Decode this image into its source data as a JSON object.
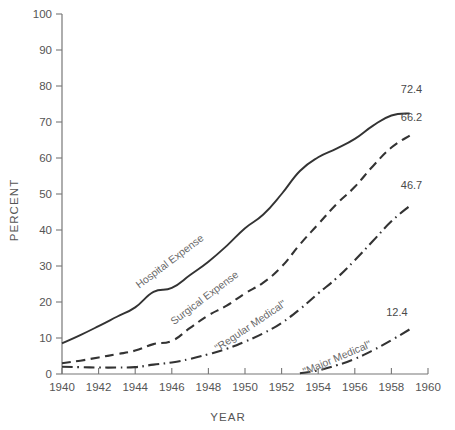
{
  "chart_data": {
    "type": "line",
    "title": "",
    "xlabel": "YEAR",
    "ylabel": "PERCENT",
    "xlim": [
      1940,
      1960
    ],
    "ylim": [
      0,
      100
    ],
    "xticks": [
      1940,
      1942,
      1944,
      1946,
      1948,
      1950,
      1952,
      1954,
      1956,
      1958,
      1960
    ],
    "xtick_labels": [
      "1940",
      "1942",
      "1944",
      "1946",
      "1948",
      "1950",
      "1952",
      "1954",
      "1956",
      "1958",
      "1960"
    ],
    "yticks": [
      0,
      10,
      20,
      30,
      40,
      50,
      60,
      70,
      80,
      90,
      100
    ],
    "ytick_labels": [
      "0",
      "10",
      "20",
      "30",
      "40",
      "50",
      "60",
      "70",
      "80",
      "90",
      "100"
    ],
    "grid": false,
    "legend_position": "inline-labels",
    "series": [
      {
        "name": "Hospital Expense",
        "label": "Hospital Expense",
        "style": "solid",
        "color": "#333333",
        "end_value_label": "72.4",
        "x": [
          1940,
          1941,
          1942,
          1943,
          1944,
          1945,
          1946,
          1947,
          1948,
          1949,
          1950,
          1951,
          1952,
          1953,
          1954,
          1955,
          1956,
          1957,
          1958,
          1959
        ],
        "values": [
          8.5,
          10.8,
          13.3,
          15.9,
          18.5,
          22.8,
          23.9,
          27.5,
          31.2,
          35.6,
          40.5,
          44.3,
          50.0,
          56.4,
          60.2,
          62.6,
          65.3,
          69.0,
          71.8,
          72.4
        ]
      },
      {
        "name": "Surgical Expense",
        "label": "Surgical Expense",
        "style": "dashed",
        "color": "#333333",
        "end_value_label": "66.2",
        "x": [
          1940,
          1941,
          1942,
          1943,
          1944,
          1945,
          1946,
          1947,
          1948,
          1949,
          1950,
          1951,
          1952,
          1953,
          1954,
          1955,
          1956,
          1957,
          1958,
          1959
        ],
        "values": [
          3.0,
          3.7,
          4.6,
          5.5,
          6.5,
          8.3,
          9.2,
          12.8,
          16.3,
          19.0,
          22.4,
          25.4,
          29.8,
          36.0,
          41.6,
          47.2,
          52.0,
          57.8,
          62.9,
          66.2
        ]
      },
      {
        "name": "Regular Medical",
        "label": "\"Regular Medical\"",
        "style": "dashdot",
        "color": "#333333",
        "end_value_label": "46.7",
        "x": [
          1940,
          1941,
          1942,
          1943,
          1944,
          1945,
          1946,
          1947,
          1948,
          1949,
          1950,
          1951,
          1952,
          1953,
          1954,
          1955,
          1956,
          1957,
          1958,
          1959
        ],
        "values": [
          2.0,
          1.9,
          1.8,
          1.8,
          1.9,
          2.6,
          3.2,
          4.2,
          5.5,
          7.0,
          9.0,
          11.3,
          14.2,
          18.0,
          22.4,
          26.6,
          31.6,
          37.0,
          42.4,
          46.7
        ]
      },
      {
        "name": "Major Medical",
        "label": "\"Major Medical\"",
        "style": "dashdot",
        "color": "#333333",
        "end_value_label": "12.4",
        "x": [
          1953,
          1954,
          1955,
          1956,
          1957,
          1958,
          1959
        ],
        "values": [
          0.2,
          1.0,
          2.4,
          4.2,
          6.6,
          9.4,
          12.4
        ]
      }
    ]
  },
  "annotations": {
    "series_labels": [
      {
        "text": "Hospital Expense",
        "x": 1946.0,
        "y": 30.5,
        "rotation": -37
      },
      {
        "text": "Surgical Expense",
        "x": 1947.9,
        "y": 20.4,
        "rotation": -37
      },
      {
        "text": "\"Regular Medical\"",
        "x": 1950.4,
        "y": 12.6,
        "rotation": -34
      },
      {
        "text": "\"Major Medical\"",
        "x": 1955.1,
        "y": 3.6,
        "rotation": -23
      }
    ],
    "end_labels": [
      {
        "text": "72.4",
        "x": 1959.1,
        "y": 78.0
      },
      {
        "text": "66.2",
        "x": 1959.1,
        "y": 70.4
      },
      {
        "text": "46.7",
        "x": 1959.1,
        "y": 51.3
      },
      {
        "text": "12.4",
        "x": 1958.3,
        "y": 16.2
      }
    ]
  }
}
